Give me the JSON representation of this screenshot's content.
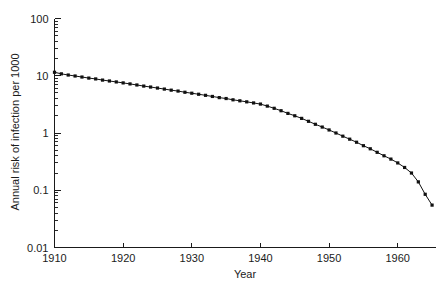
{
  "chart_data": {
    "type": "line",
    "title": "",
    "xlabel": "Year",
    "ylabel": "Annual risk of infection per 1000",
    "xlim": [
      1910,
      1965.5
    ],
    "ylim": [
      0.01,
      100
    ],
    "yscale": "log",
    "xscale": "linear",
    "grid": false,
    "legend": null,
    "xticks": [
      1910,
      1920,
      1930,
      1940,
      1950,
      1960
    ],
    "xtick_labels": [
      "1910",
      "1920",
      "1930",
      "1940",
      "1950",
      "1960"
    ],
    "yticks": [
      0.01,
      0.1,
      1,
      10,
      100
    ],
    "ytick_labels": [
      "0.01",
      "0.1",
      "1",
      "10",
      "100"
    ],
    "minor_ticks": true,
    "marker": "square",
    "line_color": "#111111",
    "series": [
      {
        "name": "Annual risk of infection",
        "x": [
          1910,
          1911,
          1912,
          1913,
          1914,
          1915,
          1916,
          1917,
          1918,
          1919,
          1920,
          1921,
          1922,
          1923,
          1924,
          1925,
          1926,
          1927,
          1928,
          1929,
          1930,
          1931,
          1932,
          1933,
          1934,
          1935,
          1936,
          1937,
          1938,
          1939,
          1940,
          1941,
          1942,
          1943,
          1944,
          1945,
          1946,
          1947,
          1948,
          1949,
          1950,
          1951,
          1952,
          1953,
          1954,
          1955,
          1956,
          1957,
          1958,
          1959,
          1960,
          1961,
          1962,
          1963,
          1964,
          1965
        ],
        "y": [
          11.5,
          10.8,
          10.3,
          9.9,
          9.5,
          9.1,
          8.8,
          8.4,
          8.1,
          7.8,
          7.5,
          7.2,
          6.9,
          6.6,
          6.35,
          6.1,
          5.85,
          5.6,
          5.4,
          5.15,
          4.95,
          4.75,
          4.55,
          4.35,
          4.15,
          4.0,
          3.8,
          3.65,
          3.5,
          3.35,
          3.2,
          2.95,
          2.7,
          2.45,
          2.2,
          2.0,
          1.8,
          1.6,
          1.42,
          1.27,
          1.13,
          1.0,
          0.88,
          0.78,
          0.69,
          0.6,
          0.53,
          0.46,
          0.4,
          0.35,
          0.3,
          0.25,
          0.2,
          0.14,
          0.085,
          0.055
        ]
      }
    ]
  },
  "axes": {
    "x_title": "Year",
    "y_title": "Annual risk of infection per 1000"
  }
}
